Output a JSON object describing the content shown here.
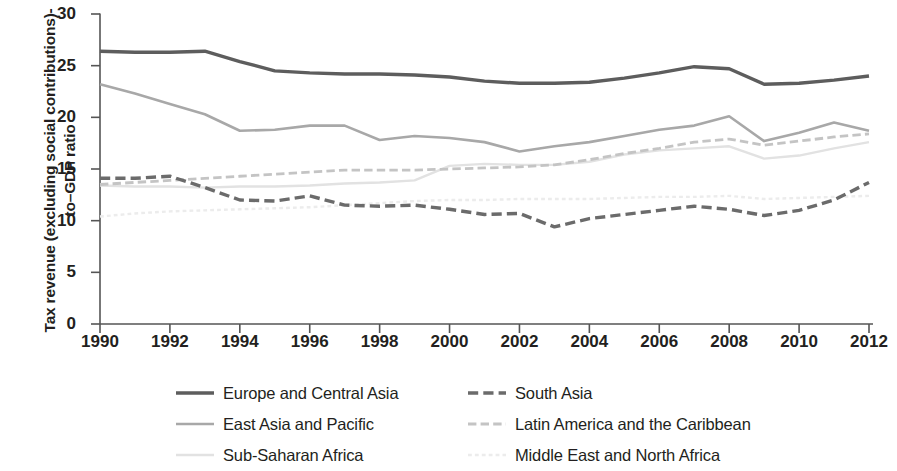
{
  "chart_data": {
    "type": "line",
    "title": "",
    "xlabel": "",
    "ylabel": "Tax revenue (excluding social contributions)-to–GDP ratio",
    "xlim": [
      1990,
      2012
    ],
    "ylim": [
      0,
      30
    ],
    "ytick_values": [
      0,
      5,
      10,
      15,
      20,
      25,
      30
    ],
    "ytick_labels": [
      "0",
      "5",
      "10",
      "15",
      "20",
      "25",
      "30"
    ],
    "xtick_values": [
      1990,
      1992,
      1994,
      1996,
      1998,
      2000,
      2002,
      2004,
      2006,
      2008,
      2010,
      2012
    ],
    "xtick_labels": [
      "1990",
      "1992",
      "1994",
      "1996",
      "1998",
      "2000",
      "2002",
      "2004",
      "2006",
      "2008",
      "2010",
      "2012"
    ],
    "grid": false,
    "legend_position": "below",
    "x": [
      1990,
      1991,
      1992,
      1993,
      1994,
      1995,
      1996,
      1997,
      1998,
      1999,
      2000,
      2001,
      2002,
      2003,
      2004,
      2005,
      2006,
      2007,
      2008,
      2009,
      2010,
      2011,
      2012
    ],
    "series": [
      {
        "name": "Europe and Central Asia",
        "color": "#5d5d5d",
        "style": "solid",
        "width": 3.4,
        "values": [
          26.4,
          26.3,
          26.3,
          26.4,
          25.4,
          24.5,
          24.3,
          24.2,
          24.2,
          24.1,
          23.9,
          23.5,
          23.3,
          23.3,
          23.4,
          23.8,
          24.3,
          24.9,
          24.7,
          23.2,
          23.3,
          23.6,
          24.0
        ]
      },
      {
        "name": "East Asia and Pacific",
        "color": "#a8a8a8",
        "style": "solid",
        "width": 2.6,
        "values": [
          23.2,
          22.3,
          21.3,
          20.3,
          18.7,
          18.8,
          19.2,
          19.2,
          17.8,
          18.2,
          18.0,
          17.6,
          16.7,
          17.2,
          17.6,
          18.2,
          18.8,
          19.2,
          20.1,
          17.7,
          18.5,
          19.5,
          18.7
        ]
      },
      {
        "name": "Sub-Saharan Africa",
        "color": "#e2e2e2",
        "style": "solid",
        "width": 2.4,
        "values": [
          13.4,
          13.3,
          13.3,
          13.2,
          13.3,
          13.3,
          13.4,
          13.6,
          13.7,
          13.9,
          15.3,
          15.5,
          15.4,
          15.4,
          15.7,
          16.4,
          16.8,
          17.0,
          17.2,
          16.0,
          16.3,
          17.0,
          17.6
        ]
      },
      {
        "name": "South Asia",
        "color": "#6b6b6b",
        "style": "dashed",
        "width": 3.4,
        "values": [
          14.1,
          14.1,
          14.3,
          13.2,
          12.0,
          11.9,
          12.4,
          11.5,
          11.4,
          11.5,
          11.1,
          10.6,
          10.7,
          9.4,
          10.2,
          10.6,
          11.0,
          11.4,
          11.1,
          10.5,
          11.0,
          12.0,
          13.7
        ]
      },
      {
        "name": "Latin America and the Caribbean",
        "color": "#c4c4c4",
        "style": "dashed",
        "width": 2.8,
        "values": [
          13.5,
          13.7,
          13.9,
          14.1,
          14.3,
          14.5,
          14.7,
          14.9,
          14.9,
          14.9,
          15.0,
          15.1,
          15.2,
          15.4,
          15.9,
          16.5,
          17.0,
          17.6,
          17.9,
          17.3,
          17.7,
          18.1,
          18.4
        ]
      },
      {
        "name": "Middle East and North Africa",
        "color": "#ececec",
        "style": "dotted",
        "width": 2.4,
        "values": [
          10.4,
          10.7,
          10.9,
          11.0,
          11.1,
          11.2,
          11.3,
          11.5,
          11.7,
          11.9,
          12.0,
          12.0,
          12.1,
          12.1,
          12.1,
          12.2,
          12.3,
          12.3,
          12.4,
          12.1,
          12.2,
          12.3,
          12.4
        ]
      }
    ]
  },
  "axis": {
    "y_title": "Tax revenue (excluding social contributions)-to–GDP ratio",
    "axis_color": "#555555"
  },
  "legend": {
    "entries": [
      {
        "label": "Europe and Central Asia",
        "series": 0,
        "column": 0,
        "row": 0
      },
      {
        "label": "East Asia and Pacific",
        "series": 1,
        "column": 0,
        "row": 1
      },
      {
        "label": "Sub-Saharan Africa",
        "series": 2,
        "column": 0,
        "row": 2
      },
      {
        "label": "South Asia",
        "series": 3,
        "column": 1,
        "row": 0
      },
      {
        "label": "Latin America and the Caribbean",
        "series": 4,
        "column": 1,
        "row": 1
      },
      {
        "label": "Middle East and North Africa",
        "series": 5,
        "column": 1,
        "row": 2
      }
    ]
  }
}
